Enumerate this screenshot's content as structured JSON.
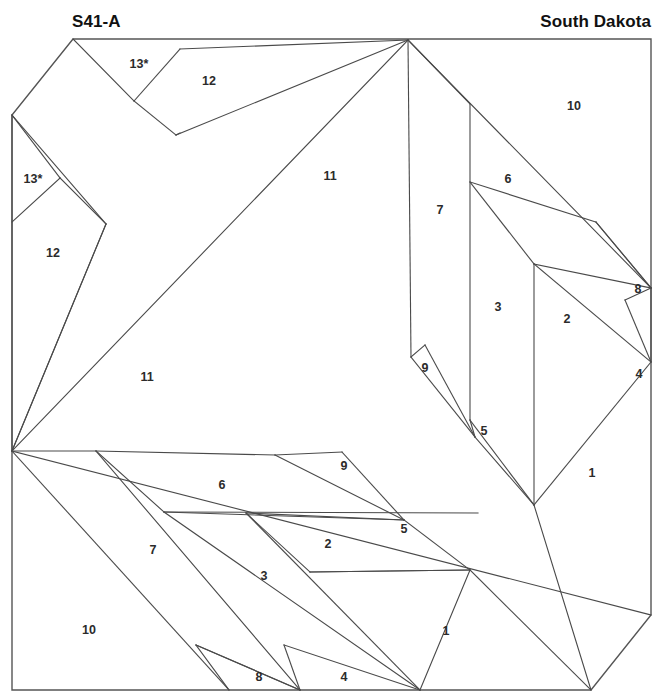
{
  "header": {
    "pattern_code": "S41-A",
    "state": "South Dakota"
  },
  "diagram": {
    "title": "S41-A",
    "kind": "foundation-piecing-block",
    "outline": {
      "top_left": [
        73,
        39
      ],
      "top_right": [
        651,
        39
      ],
      "right_lower": [
        651,
        615
      ],
      "bottom_right": [
        591,
        690
      ],
      "bottom_left": [
        12,
        690
      ],
      "left_upper": [
        12,
        115
      ]
    },
    "piece_labels": [
      {
        "id": "13a",
        "text": "13*",
        "x": 139,
        "y": 65
      },
      {
        "id": "12a",
        "text": "12",
        "x": 209,
        "y": 82
      },
      {
        "id": "10a",
        "text": "10",
        "x": 574,
        "y": 107
      },
      {
        "id": "13b",
        "text": "13*",
        "x": 33,
        "y": 180
      },
      {
        "id": "11a",
        "text": "11",
        "x": 330,
        "y": 177
      },
      {
        "id": "6a",
        "text": "6",
        "x": 508,
        "y": 180
      },
      {
        "id": "7a",
        "text": "7",
        "x": 440,
        "y": 211
      },
      {
        "id": "12b",
        "text": "12",
        "x": 53,
        "y": 254
      },
      {
        "id": "8a",
        "text": "8",
        "x": 638,
        "y": 290
      },
      {
        "id": "3a",
        "text": "3",
        "x": 498,
        "y": 308
      },
      {
        "id": "2a",
        "text": "2",
        "x": 567,
        "y": 320
      },
      {
        "id": "9a",
        "text": "9",
        "x": 425,
        "y": 369
      },
      {
        "id": "4a",
        "text": "4",
        "x": 639,
        "y": 375
      },
      {
        "id": "11b",
        "text": "11",
        "x": 147,
        "y": 378
      },
      {
        "id": "5a",
        "text": "5",
        "x": 484,
        "y": 432
      },
      {
        "id": "9b",
        "text": "9",
        "x": 344,
        "y": 467
      },
      {
        "id": "1a",
        "text": "1",
        "x": 592,
        "y": 474
      },
      {
        "id": "6b",
        "text": "6",
        "x": 222,
        "y": 486
      },
      {
        "id": "5b",
        "text": "5",
        "x": 404,
        "y": 530
      },
      {
        "id": "2b",
        "text": "2",
        "x": 328,
        "y": 545
      },
      {
        "id": "7b",
        "text": "7",
        "x": 153,
        "y": 551
      },
      {
        "id": "3b",
        "text": "3",
        "x": 264,
        "y": 577
      },
      {
        "id": "10b",
        "text": "10",
        "x": 89,
        "y": 631
      },
      {
        "id": "1b",
        "text": "1",
        "x": 446,
        "y": 632
      },
      {
        "id": "8b",
        "text": "8",
        "x": 259,
        "y": 678
      },
      {
        "id": "4b",
        "text": "4",
        "x": 344,
        "y": 678
      }
    ],
    "seam_lines": [
      {
        "id": "seam-01",
        "points": "73,39 134,101"
      },
      {
        "id": "seam-02",
        "points": "134,101 176,135"
      },
      {
        "id": "seam-03",
        "points": "176,135 180,133"
      },
      {
        "id": "seam-04",
        "points": "134,101 180,49"
      },
      {
        "id": "seam-05",
        "points": "180,49 408,40"
      },
      {
        "id": "seam-06",
        "points": "176,135 408,40"
      },
      {
        "id": "seam-07",
        "points": "12,115 60,178"
      },
      {
        "id": "seam-08",
        "points": "60,178 12,222"
      },
      {
        "id": "seam-09",
        "points": "12,115 106,224"
      },
      {
        "id": "seam-10",
        "points": "60,178 106,224"
      },
      {
        "id": "seam-11",
        "points": "106,224 12,451"
      },
      {
        "id": "seam-12",
        "points": "12,115 12,451"
      },
      {
        "id": "seam-13",
        "points": "106,224 12,451"
      },
      {
        "id": "seam-14",
        "points": "408,40 12,451"
      },
      {
        "id": "seam-15",
        "points": "408,40 411,357"
      },
      {
        "id": "seam-16",
        "points": "411,357 425,345"
      },
      {
        "id": "seam-17",
        "points": "425,345 475,437"
      },
      {
        "id": "seam-18",
        "points": "411,357 475,437"
      },
      {
        "id": "seam-19",
        "points": "470,104 470,420"
      },
      {
        "id": "seam-20",
        "points": "408,40 470,104"
      },
      {
        "id": "seam-21",
        "points": "470,420 475,437"
      },
      {
        "id": "seam-22",
        "points": "470,420 534,505"
      },
      {
        "id": "seam-23",
        "points": "475,437 534,505"
      },
      {
        "id": "seam-24",
        "points": "470,182 534,264"
      },
      {
        "id": "seam-25",
        "points": "534,264 534,505"
      },
      {
        "id": "seam-26",
        "points": "470,182 596,222"
      },
      {
        "id": "seam-27",
        "points": "596,222 651,288"
      },
      {
        "id": "seam-28",
        "points": "534,264 651,288"
      },
      {
        "id": "seam-29",
        "points": "596,222 651,288"
      },
      {
        "id": "seam-30",
        "points": "651,288 625,300"
      },
      {
        "id": "seam-31",
        "points": "625,300 651,362"
      },
      {
        "id": "seam-32",
        "points": "651,288 651,362"
      },
      {
        "id": "seam-33",
        "points": "534,264 651,362"
      },
      {
        "id": "seam-34",
        "points": "408,40 651,288"
      },
      {
        "id": "seam-35",
        "points": "651,362 534,505"
      },
      {
        "id": "seam-36",
        "points": "534,505 591,690"
      },
      {
        "id": "seam-37",
        "points": "12,451 651,615"
      },
      {
        "id": "seam-38",
        "points": "12,451 96,451"
      },
      {
        "id": "seam-39",
        "points": "96,451 275,455"
      },
      {
        "id": "seam-40",
        "points": "275,455 342,452"
      },
      {
        "id": "seam-41",
        "points": "342,452 404,520"
      },
      {
        "id": "seam-42",
        "points": "275,455 404,520"
      },
      {
        "id": "seam-43",
        "points": "96,451 164,512"
      },
      {
        "id": "seam-44",
        "points": "164,512 478,513"
      },
      {
        "id": "seam-45",
        "points": "164,512 404,520"
      },
      {
        "id": "seam-46",
        "points": "246,513 404,520"
      },
      {
        "id": "seam-47",
        "points": "246,513 310,572"
      },
      {
        "id": "seam-48",
        "points": "310,572 470,570"
      },
      {
        "id": "seam-49",
        "points": "310,572 470,570"
      },
      {
        "id": "seam-50",
        "points": "404,520 470,570"
      },
      {
        "id": "seam-51",
        "points": "12,451 229,690"
      },
      {
        "id": "seam-52",
        "points": "196,645 229,690"
      },
      {
        "id": "seam-53",
        "points": "196,645 300,690"
      },
      {
        "id": "seam-54",
        "points": "196,645 300,690"
      },
      {
        "id": "seam-55",
        "points": "96,451 300,690"
      },
      {
        "id": "seam-56",
        "points": "284,645 300,690"
      },
      {
        "id": "seam-57",
        "points": "284,645 420,690"
      },
      {
        "id": "seam-58",
        "points": "164,512 420,690"
      },
      {
        "id": "seam-59",
        "points": "246,513 420,690"
      },
      {
        "id": "seam-60",
        "points": "470,570 591,690"
      },
      {
        "id": "seam-61",
        "points": "470,570 420,690"
      }
    ]
  }
}
